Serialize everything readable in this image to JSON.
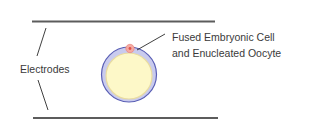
{
  "labels": {
    "electrodes": "Electrodes",
    "cell_line1": "Fused Embryonic Cell",
    "cell_line2": "and Enucleated Oocyte"
  },
  "colors": {
    "electrode_plate": "#5c5c5c",
    "pointer_line": "#2a2a2a",
    "zona_fill": "#c9cbee",
    "zona_stroke": "#5a5fb5",
    "cytoplasm_fill": "#fdf8c8",
    "cytoplasm_edge": "#e9dca0",
    "embryonic_cell_fill": "#f4aaa2",
    "embryonic_cell_nucleus": "#e0524a",
    "text": "#3a3a3a"
  },
  "geometry": {
    "top_electrode": {
      "x1": 32,
      "y1": 21.5,
      "x2": 215,
      "y2": 21.5
    },
    "bottom_electrode": {
      "x1": 33,
      "y1": 118,
      "x2": 218,
      "y2": 118
    },
    "oocyte": {
      "cx": 129,
      "cy": 74.5,
      "r_outer": 28,
      "r_inner": 23
    },
    "embryonic_cell": {
      "cx": 130,
      "cy": 48,
      "r": 4
    }
  }
}
